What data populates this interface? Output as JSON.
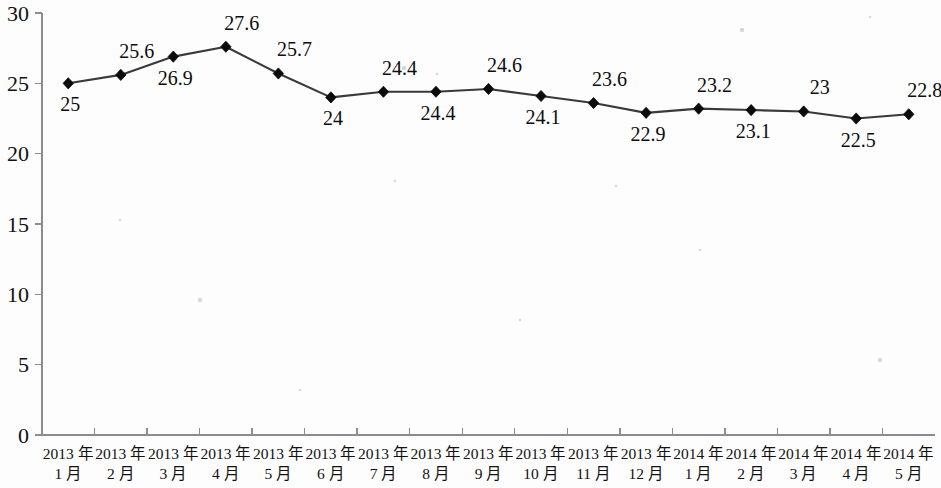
{
  "chart_data": {
    "type": "line",
    "title": "",
    "subtitle": "",
    "xlabel": "",
    "ylabel": "",
    "ylim": [
      0,
      30
    ],
    "yticks": [
      0,
      5,
      10,
      15,
      20,
      25,
      30
    ],
    "ytick_labels": [
      "0",
      "5",
      "10",
      "15",
      "20",
      "25",
      "30"
    ],
    "grid": false,
    "legend": false,
    "legend_position": "none",
    "marker": "diamond",
    "line_color": "#3a3a3a",
    "marker_color": "#0a0a0a",
    "axis_color": "#8c8c8c",
    "categories": [
      "2013 年 1 月",
      "2013 年 2 月",
      "2013 年 3 月",
      "2013 年 4 月",
      "2013 年 5 月",
      "2013 年 6 月",
      "2013 年 7 月",
      "2013 年 8 月",
      "2013 年 9 月",
      "2013 年 10 月",
      "2013 年 11 月",
      "2013 年 12 月",
      "2014 年 1 月",
      "2014 年 2 月",
      "2014 年 3 月",
      "2014 年 4 月",
      "2014 年 5 月"
    ],
    "category_lines": [
      [
        "2013 年",
        "1 月"
      ],
      [
        "2013 年",
        "2 月"
      ],
      [
        "2013 年",
        "3 月"
      ],
      [
        "2013 年",
        "4 月"
      ],
      [
        "2013 年",
        "5 月"
      ],
      [
        "2013 年",
        "6 月"
      ],
      [
        "2013 年",
        "7 月"
      ],
      [
        "2013 年",
        "8 月"
      ],
      [
        "2013 年",
        "9 月"
      ],
      [
        "2013 年",
        "10 月"
      ],
      [
        "2013 年",
        "11 月"
      ],
      [
        "2013 年",
        "12 月"
      ],
      [
        "2014 年",
        "1 月"
      ],
      [
        "2014 年",
        "2 月"
      ],
      [
        "2014 年",
        "3 月"
      ],
      [
        "2014 年",
        "4 月"
      ],
      [
        "2014 年",
        "5 月"
      ]
    ],
    "values": [
      25,
      25.6,
      26.9,
      27.6,
      25.7,
      24,
      24.4,
      24.4,
      24.6,
      24.1,
      23.6,
      22.9,
      23.2,
      23.1,
      23,
      22.5,
      22.8
    ],
    "value_labels": [
      "25",
      "25.6",
      "26.9",
      "27.6",
      "25.7",
      "24",
      "24.4",
      "24.4",
      "24.6",
      "24.1",
      "23.6",
      "22.9",
      "23.2",
      "23.1",
      "23",
      "22.5",
      "22.8"
    ],
    "label_positions": [
      "below",
      "above",
      "below",
      "above",
      "above",
      "below",
      "above",
      "below",
      "above",
      "below",
      "above",
      "below",
      "above",
      "below",
      "above",
      "below",
      "above"
    ]
  }
}
